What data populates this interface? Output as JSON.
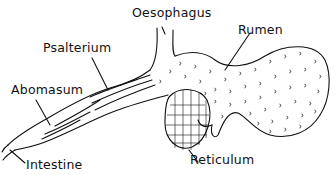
{
  "diagram": {
    "labels": {
      "oesophagus": "Oesophagus",
      "rumen": "Rumen",
      "psalterium": "Psalterium",
      "abomasum": "Abomasum",
      "reticulum": "Reticulum",
      "intestine": "Intestine"
    },
    "colors": {
      "ink": "#111111",
      "background": "#ffffff"
    }
  }
}
